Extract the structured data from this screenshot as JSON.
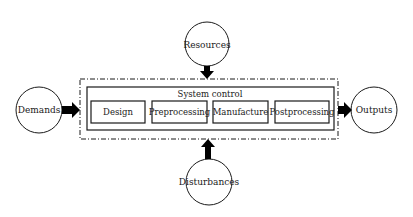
{
  "diagram": {
    "inputs": {
      "resources": "Resources",
      "demands": "Demands",
      "disturbances": "Disturbances"
    },
    "output": "Outputs",
    "system": {
      "title": "System control",
      "stages": [
        "Design",
        "Preprocessing",
        "Manufacture",
        "Postprocessing"
      ]
    },
    "colors": {
      "stroke": "#1a1a1a",
      "arrow": "#000000",
      "background": "#ffffff"
    }
  }
}
